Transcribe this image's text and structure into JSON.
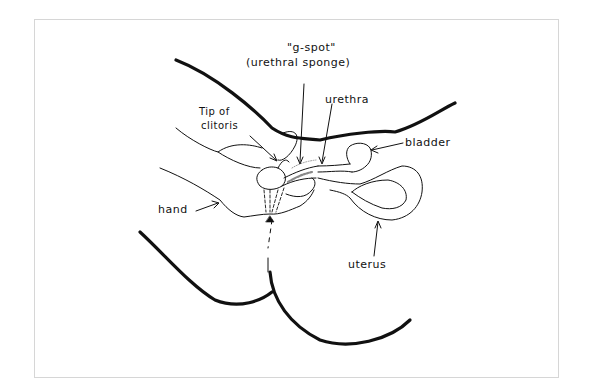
{
  "diagram": {
    "type": "anatomical-line-drawing",
    "style": "hand-drawn black ink on white",
    "labels": {
      "gspot_line1": "\"g-spot\"",
      "gspot_line2": "(urethral sponge)",
      "urethra": "urethra",
      "clitoris_line1": "Tip of",
      "clitoris_line2": "clitoris",
      "bladder": "bladder",
      "hand": "hand",
      "uterus": "uterus"
    },
    "colors": {
      "ink": "#111111",
      "frame": "#d6d6d6",
      "background": "#ffffff"
    }
  }
}
